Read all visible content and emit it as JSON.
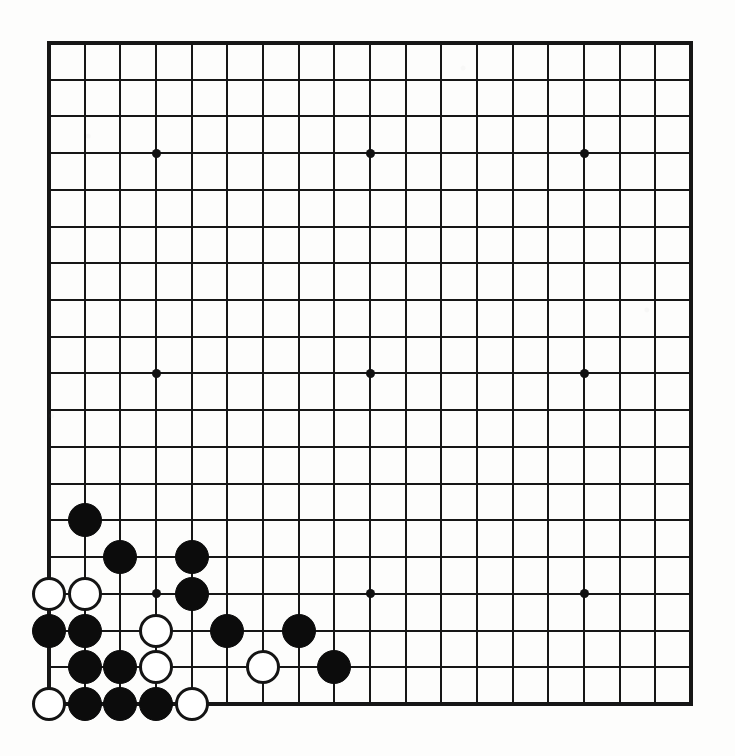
{
  "board": {
    "title": "Go Board Position",
    "size_label": "19x19",
    "columns": 19,
    "rows": 19,
    "origin_x": 49,
    "origin_y": 43,
    "cell_width": 35.67,
    "cell_height": 36.72,
    "stone_radius": 17,
    "line_color": "#161616",
    "board_color": "#fdfdfc",
    "black_color": "#0c0c0c",
    "white_color": "#ffffff",
    "star_points": [
      {
        "col": 3,
        "row": 3
      },
      {
        "col": 9,
        "row": 3
      },
      {
        "col": 15,
        "row": 3
      },
      {
        "col": 3,
        "row": 9
      },
      {
        "col": 9,
        "row": 9
      },
      {
        "col": 15,
        "row": 9
      },
      {
        "col": 3,
        "row": 15
      },
      {
        "col": 9,
        "row": 15
      },
      {
        "col": 15,
        "row": 15
      }
    ],
    "stones": [
      {
        "color": "black",
        "col": 1,
        "row": 13
      },
      {
        "color": "black",
        "col": 2,
        "row": 14
      },
      {
        "color": "black",
        "col": 4,
        "row": 14
      },
      {
        "color": "white",
        "col": 0,
        "row": 15
      },
      {
        "color": "white",
        "col": 1,
        "row": 15
      },
      {
        "color": "black",
        "col": 4,
        "row": 15
      },
      {
        "color": "black",
        "col": 0,
        "row": 16
      },
      {
        "color": "black",
        "col": 1,
        "row": 16
      },
      {
        "color": "white",
        "col": 3,
        "row": 16
      },
      {
        "color": "black",
        "col": 5,
        "row": 16
      },
      {
        "color": "black",
        "col": 7,
        "row": 16
      },
      {
        "color": "black",
        "col": 1,
        "row": 17
      },
      {
        "color": "black",
        "col": 2,
        "row": 17
      },
      {
        "color": "white",
        "col": 3,
        "row": 17
      },
      {
        "color": "white",
        "col": 6,
        "row": 17
      },
      {
        "color": "black",
        "col": 8,
        "row": 17
      },
      {
        "color": "white",
        "col": 0,
        "row": 18
      },
      {
        "color": "black",
        "col": 1,
        "row": 18
      },
      {
        "color": "black",
        "col": 2,
        "row": 18
      },
      {
        "color": "black",
        "col": 3,
        "row": 18
      },
      {
        "color": "white",
        "col": 4,
        "row": 18
      }
    ]
  }
}
